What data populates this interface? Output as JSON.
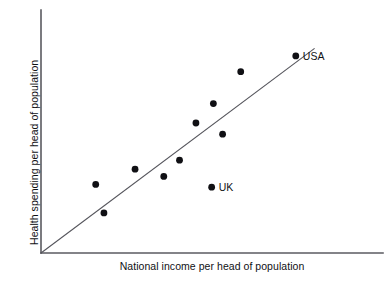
{
  "chart_data": {
    "type": "scatter",
    "title": "",
    "xlabel": "National income per head of population",
    "ylabel": "Health spending per head of population",
    "xlim": [
      0,
      100
    ],
    "ylim": [
      0,
      100
    ],
    "grid": false,
    "legend": "none",
    "axis_ticks": "none",
    "annotations": [
      {
        "name": "USA",
        "label": "USA",
        "x": 74.5,
        "y": 81.1
      },
      {
        "name": "UK",
        "label": "UK",
        "x": 49.9,
        "y": 27.1
      }
    ],
    "series": [
      {
        "name": "Countries",
        "marker": "filled-circle",
        "color": "#101014",
        "points": [
          {
            "label": "",
            "x": 16.0,
            "y": 28.2
          },
          {
            "label": "",
            "x": 18.4,
            "y": 16.5
          },
          {
            "label": "",
            "x": 27.5,
            "y": 34.5
          },
          {
            "label": "",
            "x": 35.9,
            "y": 31.5
          },
          {
            "label": "",
            "x": 40.5,
            "y": 38.2
          },
          {
            "label": "",
            "x": 45.3,
            "y": 53.5
          },
          {
            "label": "",
            "x": 50.4,
            "y": 61.5
          },
          {
            "label": "",
            "x": 53.1,
            "y": 48.9
          },
          {
            "label": "",
            "x": 58.4,
            "y": 74.6
          },
          {
            "label": "USA",
            "x": 74.5,
            "y": 81.1
          },
          {
            "label": "UK",
            "x": 49.9,
            "y": 27.1
          }
        ]
      }
    ],
    "reference_line": {
      "name": "diagonal-trend-line",
      "from": {
        "x": 0,
        "y": 0
      },
      "to": {
        "x": 80.0,
        "y": 84.2
      },
      "color": "#55555c"
    }
  }
}
